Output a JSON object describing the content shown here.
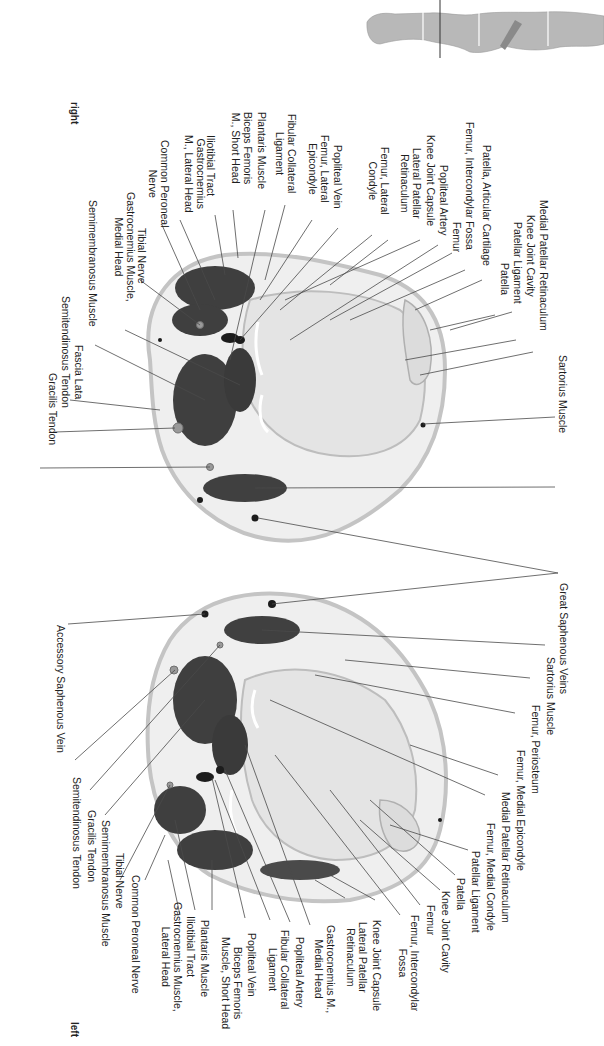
{
  "page": {
    "orientation_labels": {
      "right": "right",
      "left": "left"
    },
    "thumbnail": {
      "description": "body silhouette with section marker at knee level"
    }
  },
  "colors": {
    "muscle": "#3f3f3f",
    "bone": "#e6e6e6",
    "fat": "#efefef",
    "skin": "#c9c9c9",
    "leader_line": "#4a4a4a",
    "vessel": "#1c1c1c"
  },
  "upper_section": {
    "side": "right",
    "labels": [
      {
        "id": "u1",
        "text": "Sartorius Muscle"
      },
      {
        "id": "u2",
        "text": "Medial Patellar Retinaculum"
      },
      {
        "id": "u3",
        "text": "Knee Joint Cavity"
      },
      {
        "id": "u4",
        "text": "Patellar Ligament"
      },
      {
        "id": "u5",
        "text": "Patella"
      },
      {
        "id": "u6",
        "text": "Patella, Articular Cartilage"
      },
      {
        "id": "u7",
        "text": "Femur, Intercondylar Fossa"
      },
      {
        "id": "u8",
        "text": "Femur"
      },
      {
        "id": "u9",
        "text": "Popliteal Artery"
      },
      {
        "id": "u10",
        "text": "Knee Joint Capsule"
      },
      {
        "id": "u11",
        "text": "Lateral Patellar\nRetinaculum"
      },
      {
        "id": "u12",
        "text": "Femur, Lateral\nCondyle"
      },
      {
        "id": "u13",
        "text": "Popliteal Vein"
      },
      {
        "id": "u14",
        "text": "Femur, Lateral\nEpicondyle"
      },
      {
        "id": "u15",
        "text": "Fibular Collateral\nLigament"
      },
      {
        "id": "u16",
        "text": "Plantaris Muscle"
      },
      {
        "id": "u17",
        "text": "Biceps Femoris\nM., Short Head"
      },
      {
        "id": "u18",
        "text": "Iliotibial Tract"
      },
      {
        "id": "u19",
        "text": "Gastrocnemius\nM., Lateral Head"
      },
      {
        "id": "u20",
        "text": "Common Peroneal\nNerve"
      },
      {
        "id": "u21",
        "text": "Tibial Nerve"
      },
      {
        "id": "u22",
        "text": "Gastrocnemius Muscle,\nMedial Head"
      },
      {
        "id": "u23",
        "text": "Semimembranosus Muscle"
      },
      {
        "id": "u24",
        "text": "Fascia Lata"
      },
      {
        "id": "u25",
        "text": "Semitendinosus Tendon"
      },
      {
        "id": "u26",
        "text": "Gracilis Tendon"
      }
    ]
  },
  "shared_label": {
    "text": "Great Saphenous Veins"
  },
  "lower_section": {
    "side": "left",
    "labels": [
      {
        "id": "l1",
        "text": "Sartorius Muscle"
      },
      {
        "id": "l2",
        "text": "Femur, Periosteum"
      },
      {
        "id": "l3",
        "text": "Femur, Medial Epicondyle"
      },
      {
        "id": "l4",
        "text": "Medial Patellar Retinaculum"
      },
      {
        "id": "l5",
        "text": "Femur, Medial Condyle"
      },
      {
        "id": "l6",
        "text": "Patellar Ligament"
      },
      {
        "id": "l7",
        "text": "Patella"
      },
      {
        "id": "l8",
        "text": "Knee Joint Cavity"
      },
      {
        "id": "l9",
        "text": "Femur"
      },
      {
        "id": "l10",
        "text": "Femur, Intercondylar\nFossa"
      },
      {
        "id": "l11",
        "text": "Knee Joint Capsule"
      },
      {
        "id": "l12",
        "text": "Lateral Patellar\nRetinaculum"
      },
      {
        "id": "l13",
        "text": "Gastrocnemius M.,\nMedial Head"
      },
      {
        "id": "l14",
        "text": "Popliteal Artery"
      },
      {
        "id": "l15",
        "text": "Fibular Collateral\nLigament"
      },
      {
        "id": "l16",
        "text": "Popliteal Vein"
      },
      {
        "id": "l17",
        "text": "Biceps Femoris\nMuscle, Short Head"
      },
      {
        "id": "l18",
        "text": "Plantaris Muscle"
      },
      {
        "id": "l19",
        "text": "Iliotibial Tract"
      },
      {
        "id": "l20",
        "text": "Gastrocnemius Muscle,\nLateral Head"
      },
      {
        "id": "l21",
        "text": "Common Peroneal Nerve"
      },
      {
        "id": "l22",
        "text": "Tibial Nerve"
      },
      {
        "id": "l23",
        "text": "Semimembranosus Muscle"
      },
      {
        "id": "l24",
        "text": "Gracilis Tendon"
      },
      {
        "id": "l25",
        "text": "Semitendinosus Tendon"
      },
      {
        "id": "l26",
        "text": "Accessory Saphenous Vein"
      }
    ]
  }
}
